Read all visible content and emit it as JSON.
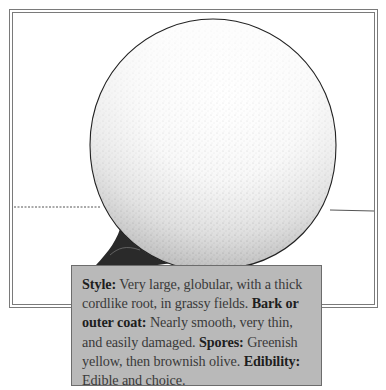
{
  "illustration": {
    "subject": "puffball-mushroom-illustration",
    "style": "stippled pen-and-ink drawing",
    "elements": [
      "globe-cap",
      "cordlike-root",
      "horizon-line",
      "double-line-frame"
    ]
  },
  "caption": {
    "segments": [
      {
        "label": "Style:",
        "text": " Very large, globular, with a thick cordlike root, in grassy fields. "
      },
      {
        "label": "Bark or outer coat:",
        "text": " Nearly smooth, very thin, and easily damaged. "
      },
      {
        "label": "Spores:",
        "text": " Greenish yellow, then brownish olive. "
      },
      {
        "label": "Edibility:",
        "text": " Edible and choice."
      }
    ]
  },
  "colors": {
    "caption_background": "#b9b9b9",
    "caption_border": "#6c6c6c",
    "frame_line": "#7a7a7a",
    "ink": "#1e1e1e"
  }
}
